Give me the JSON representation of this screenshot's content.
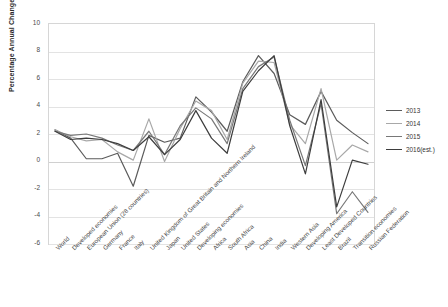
{
  "chart_data": {
    "type": "line",
    "title": "",
    "xlabel": "",
    "ylabel": "Percentage Annual Change",
    "ylim": [
      -6,
      10
    ],
    "yticks": [
      10,
      8,
      6,
      4,
      2,
      0,
      -2,
      -4,
      -6
    ],
    "grid": true,
    "legend_position": "right",
    "categories": [
      "World",
      "Developed economies",
      "European Union (28 countries)",
      "Germany",
      "France",
      "Italy",
      "United Kingdom of Great Britain and Northern Ireland",
      "Japan",
      "United States",
      "Developing economies",
      "Africa",
      "South Africa",
      "Asia",
      "China",
      "India",
      "Western Asia",
      "Developing America",
      "Least Developed Countries",
      "Brazil",
      "Transition economies",
      "Russian Federation"
    ],
    "series": [
      {
        "name": "2013",
        "color": "#5b5b5b",
        "values": [
          2.3,
          1.7,
          0.2,
          0.2,
          0.6,
          -1.8,
          1.9,
          1.4,
          1.7,
          4.7,
          3.6,
          2.2,
          5.8,
          7.7,
          6.4,
          3.4,
          2.7,
          5.1,
          3.0,
          2.1,
          1.3
        ]
      },
      {
        "name": "2014",
        "color": "#a8a8a8",
        "values": [
          2.3,
          1.8,
          1.5,
          1.6,
          0.7,
          0.1,
          3.1,
          0.0,
          2.4,
          4.4,
          3.7,
          1.6,
          5.7,
          7.3,
          7.2,
          2.7,
          1.3,
          5.3,
          0.1,
          1.2,
          0.7
        ]
      },
      {
        "name": "2015",
        "color": "#787878",
        "values": [
          2.2,
          1.9,
          2.0,
          1.7,
          1.2,
          0.8,
          2.2,
          0.5,
          2.6,
          3.9,
          3.1,
          1.3,
          5.3,
          6.9,
          7.6,
          3.0,
          -0.3,
          4.2,
          -3.8,
          -2.2,
          -3.7
        ]
      },
      {
        "name": "2016(est.)",
        "color": "#3d3d3d",
        "values": [
          2.2,
          1.6,
          1.7,
          1.6,
          1.3,
          0.8,
          1.8,
          0.5,
          1.6,
          3.7,
          1.7,
          0.6,
          5.1,
          6.6,
          7.7,
          2.6,
          -0.9,
          4.5,
          -3.3,
          0.1,
          -0.2
        ]
      }
    ],
    "legend": [
      "2013",
      "2014",
      "2015",
      "2016(est.)"
    ]
  },
  "caption": {
    "text": ""
  }
}
